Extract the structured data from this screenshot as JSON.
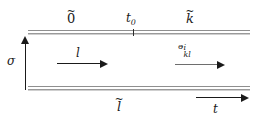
{
  "figure": {
    "kind": "worldsheet-strip-diagram",
    "background_color": "#ffffff",
    "ink_color": "#1a1a1a",
    "strip_color": "#8f8f8f",
    "width_px": 256,
    "height_px": 123
  },
  "boundaries": {
    "top": {
      "name": "top-boundary",
      "left_label": "0",
      "left_accent": "~",
      "right_label": "k",
      "right_accent": "~",
      "marker_label_base": "t",
      "marker_label_sub": "0"
    },
    "bottom": {
      "name": "bottom-boundary",
      "label": "l",
      "accent": "~"
    }
  },
  "axes": {
    "vertical": {
      "symbol": "σ",
      "direction": "up"
    },
    "horizontal": {
      "symbol": "t",
      "direction": "right"
    }
  },
  "flows": [
    {
      "name": "flow-l",
      "label": "l",
      "direction": "right",
      "color": "#1a1a1a"
    },
    {
      "name": "flow-n",
      "label_base": "ᵊ",
      "label_sup": "i",
      "label_sub": "kl",
      "direction": "right",
      "color": "#6e6e6e"
    }
  ]
}
